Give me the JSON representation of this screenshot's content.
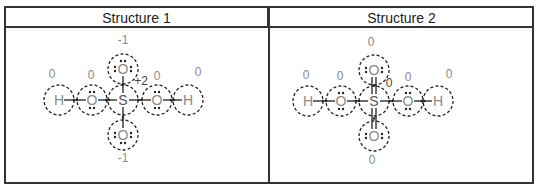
{
  "table": {
    "headers": [
      "Structure 1",
      "Structure 2"
    ]
  },
  "structures": [
    {
      "title": "Structure 1",
      "central": {
        "symbol": "S",
        "x": 123,
        "y": 100
      },
      "atoms": [
        {
          "symbol": "H",
          "x": 59,
          "y": 100,
          "charge": "0",
          "lx": 52,
          "ly": 78
        },
        {
          "symbol": "O",
          "x": 92,
          "y": 100,
          "charge": "0",
          "lx": 91,
          "ly": 79
        },
        {
          "symbol": "O",
          "x": 123,
          "y": 69,
          "charge": "-1",
          "lx": 123,
          "ly": 44
        },
        {
          "symbol": "O",
          "x": 157,
          "y": 100,
          "charge": "0",
          "lx": 157,
          "ly": 80
        },
        {
          "symbol": "H",
          "x": 188,
          "y": 100,
          "charge": "0",
          "lx": 198,
          "ly": 76
        },
        {
          "symbol": "O",
          "x": 123,
          "y": 135,
          "charge": "-1",
          "lx": 123,
          "ly": 162
        }
      ],
      "central_charge": {
        "text": "+2",
        "x": 141,
        "y": 85
      },
      "bond_type_vertical": "single"
    },
    {
      "title": "Structure 2",
      "central": {
        "symbol": "S",
        "x": 374,
        "y": 101
      },
      "atoms": [
        {
          "symbol": "H",
          "x": 308,
          "y": 101,
          "charge": "0",
          "lx": 306,
          "ly": 79
        },
        {
          "symbol": "O",
          "x": 341,
          "y": 101,
          "charge": "0",
          "lx": 340,
          "ly": 80
        },
        {
          "symbol": "O",
          "x": 374,
          "y": 70,
          "charge": "0",
          "lx": 371,
          "ly": 46
        },
        {
          "symbol": "O",
          "x": 408,
          "y": 101,
          "charge": "0",
          "lx": 408,
          "ly": 81
        },
        {
          "symbol": "H",
          "x": 438,
          "y": 101,
          "charge": "0",
          "lx": 449,
          "ly": 78
        },
        {
          "symbol": "O",
          "x": 374,
          "y": 136,
          "charge": "0",
          "lx": 372,
          "ly": 164
        }
      ],
      "central_charge": {
        "text": "0",
        "x": 389,
        "y": 87
      },
      "bond_type_vertical": "double"
    }
  ],
  "colors": {
    "border": "#333333",
    "atom": "#8a8a8a",
    "charge": "#8a8a8a",
    "bond": "#222222",
    "dashed": "#222222"
  }
}
